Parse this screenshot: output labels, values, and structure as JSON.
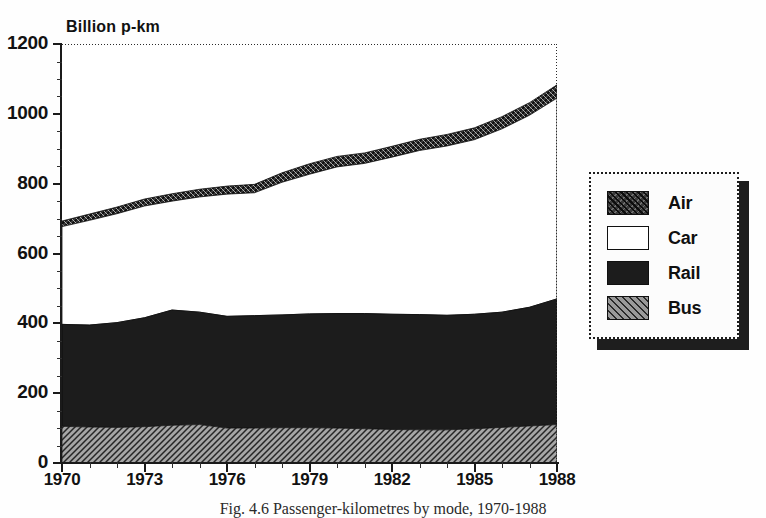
{
  "figure": {
    "caption": "Fig. 4.6 Passenger-kilometres by mode, 1970-1988"
  },
  "chart_data": {
    "type": "area",
    "stacked": true,
    "title": "",
    "subtitle": "",
    "xlabel": "",
    "ylabel": "Billion p-km",
    "unit_label": "Billion p-km",
    "xlim": [
      1970,
      1988
    ],
    "ylim": [
      0,
      1200
    ],
    "grid": false,
    "legend_position": "right",
    "y_ticks": [
      0,
      200,
      400,
      600,
      800,
      1000,
      1200
    ],
    "y_tick_labels": [
      "0",
      "200",
      "400",
      "600",
      "800",
      "1000",
      "1200"
    ],
    "y_minor_tick_step": 50,
    "x_ticks": [
      1970,
      1973,
      1976,
      1979,
      1982,
      1985,
      1988
    ],
    "x_tick_labels": [
      "1970",
      "1973",
      "1976",
      "1979",
      "1982",
      "1985",
      "1988"
    ],
    "x_minor_tick_step": 1,
    "x": [
      1970,
      1971,
      1972,
      1973,
      1974,
      1975,
      1976,
      1977,
      1978,
      1979,
      1980,
      1981,
      1982,
      1983,
      1984,
      1985,
      1986,
      1987,
      1988
    ],
    "stack_order_bottom_to_top": [
      "Bus",
      "Rail",
      "Car",
      "Air"
    ],
    "series": [
      {
        "name": "Bus",
        "color": "#9a9a9a",
        "pattern": "diagonal-hatch-light",
        "values": [
          105,
          103,
          102,
          104,
          108,
          110,
          100,
          100,
          101,
          101,
          100,
          98,
          96,
          95,
          95,
          98,
          102,
          106,
          110
        ]
      },
      {
        "name": "Rail",
        "color": "#1c1c1c",
        "pattern": "solid-dark",
        "values": [
          292,
          292,
          300,
          312,
          330,
          322,
          320,
          322,
          323,
          326,
          328,
          330,
          330,
          330,
          328,
          328,
          330,
          340,
          360
        ]
      },
      {
        "name": "Car",
        "color": "#ffffff",
        "pattern": "empty",
        "values": [
          280,
          300,
          312,
          320,
          312,
          330,
          350,
          352,
          380,
          400,
          420,
          430,
          450,
          470,
          485,
          500,
          525,
          550,
          575
        ]
      },
      {
        "name": "Air",
        "color": "#3a3a3a",
        "pattern": "crosshatch-dark",
        "values": [
          16,
          18,
          19,
          20,
          21,
          22,
          23,
          24,
          27,
          30,
          30,
          30,
          31,
          32,
          33,
          34,
          35,
          36,
          38
        ]
      }
    ],
    "stack_tops": {
      "Bus": [
        105,
        103,
        102,
        104,
        108,
        110,
        100,
        100,
        101,
        101,
        100,
        98,
        96,
        95,
        95,
        98,
        102,
        106,
        110
      ],
      "Rail": [
        397,
        395,
        402,
        416,
        438,
        432,
        420,
        422,
        424,
        427,
        428,
        428,
        426,
        425,
        423,
        426,
        432,
        446,
        470
      ],
      "Car": [
        677,
        695,
        714,
        736,
        750,
        762,
        770,
        774,
        804,
        827,
        848,
        858,
        876,
        895,
        908,
        926,
        957,
        996,
        1045
      ],
      "Air": [
        693,
        713,
        733,
        756,
        771,
        784,
        793,
        798,
        831,
        857,
        878,
        888,
        907,
        927,
        941,
        960,
        992,
        1032,
        1083
      ]
    }
  },
  "legend": {
    "items": [
      {
        "label": "Air",
        "swatch": "air-swatch"
      },
      {
        "label": "Car",
        "swatch": "car-swatch"
      },
      {
        "label": "Rail",
        "swatch": "rail-swatch"
      },
      {
        "label": "Bus",
        "swatch": "bus-swatch"
      }
    ]
  }
}
